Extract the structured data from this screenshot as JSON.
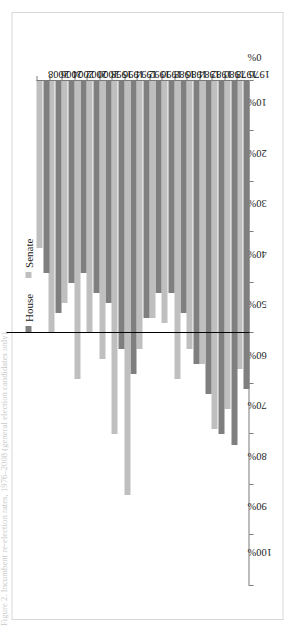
{
  "caption": "Figure 2. Incumbent re-election rates, 1976–2008 (general election candidates only).",
  "legend": {
    "position": "top-center",
    "entries": [
      {
        "label": "House",
        "color": "#7f7f7f",
        "marker": "square-marker-house"
      },
      {
        "label": "Senate",
        "color": "#bfbfbf",
        "marker": "square-marker-senate"
      }
    ]
  },
  "axes": {
    "value_axis_labels": [
      "100%",
      "90%",
      "80%",
      "70%",
      "60%",
      "50%",
      "40%",
      "30%",
      "20%",
      "10%",
      "0%"
    ],
    "value_axis_min": 0,
    "value_axis_max": 100,
    "value_axis_direction": "right-to-left",
    "reference_line_value": 50,
    "category_axis_labels": [
      "2008",
      "2006",
      "2004",
      "2002",
      "2000",
      "1998",
      "1996",
      "1994",
      "1992",
      "1990",
      "1988",
      "1986",
      "1984",
      "1982",
      "1980",
      "1978",
      "1976"
    ]
  },
  "chart_data": {
    "type": "bar",
    "orientation": "horizontal",
    "title": "",
    "subtitle": "",
    "xlabel": "",
    "ylabel": "",
    "xlim": [
      0,
      100
    ],
    "grid": false,
    "legend_position": "top-center",
    "categories": [
      "1976",
      "1978",
      "1980",
      "1982",
      "1984",
      "1986",
      "1988",
      "1990",
      "1992",
      "1994",
      "1996",
      "1998",
      "2000",
      "2002",
      "2004",
      "2006",
      "2008"
    ],
    "series": [
      {
        "name": "House",
        "color": "#7f7f7f",
        "values": [
          61,
          72,
          70,
          62,
          56,
          46,
          42,
          42,
          47,
          58,
          53,
          44,
          42,
          38,
          40,
          46,
          38
        ]
      },
      {
        "name": "Senate",
        "color": "#bfbfbf",
        "values": [
          57,
          65,
          69,
          56,
          53,
          59,
          48,
          47,
          53,
          82,
          70,
          55,
          50,
          59,
          44,
          50,
          33
        ]
      }
    ],
    "annotations": [
      {
        "type": "reference-line",
        "value": 50,
        "label": "50%",
        "color": "#000000"
      }
    ]
  }
}
